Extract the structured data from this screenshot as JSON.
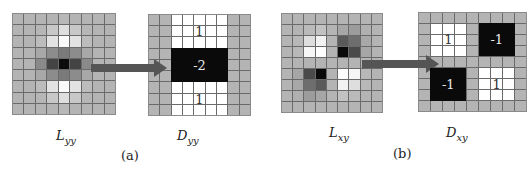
{
  "panels": [
    {
      "id": "a",
      "caption": "(a)",
      "source": {
        "name": "L",
        "subscript": "yy",
        "description": "Discretized Gaussian second-order derivative in y direction",
        "grid_size": 9,
        "cells": [
          [
            "#b4b4b4",
            "#b4b4b4",
            "#b4b4b4",
            "#b4b4b4",
            "#b8b8b8",
            "#b4b4b4",
            "#b4b4b4",
            "#b4b4b4",
            "#b4b4b4"
          ],
          [
            "#b4b4b4",
            "#b4b4b4",
            "#b6b6b6",
            "#c8c8c8",
            "#dedede",
            "#c8c8c8",
            "#b6b6b6",
            "#b4b4b4",
            "#b4b4b4"
          ],
          [
            "#b4b4b4",
            "#b4b4b4",
            "#bcbcbc",
            "#e2e2e2",
            "#fafafa",
            "#e2e2e2",
            "#bcbcbc",
            "#b4b4b4",
            "#b4b4b4"
          ],
          [
            "#b4b4b4",
            "#b4b4b4",
            "#a8a8a8",
            "#8c8c8c",
            "#7a7a7a",
            "#8c8c8c",
            "#a8a8a8",
            "#b4b4b4",
            "#b4b4b4"
          ],
          [
            "#b4b4b4",
            "#b4b4b4",
            "#8a8a8a",
            "#444444",
            "#0c0c0c",
            "#444444",
            "#8a8a8a",
            "#b4b4b4",
            "#b4b4b4"
          ],
          [
            "#b4b4b4",
            "#b4b4b4",
            "#a8a8a8",
            "#8c8c8c",
            "#7a7a7a",
            "#8c8c8c",
            "#a8a8a8",
            "#b4b4b4",
            "#b4b4b4"
          ],
          [
            "#b4b4b4",
            "#b4b4b4",
            "#bcbcbc",
            "#e2e2e2",
            "#fafafa",
            "#e2e2e2",
            "#bcbcbc",
            "#b4b4b4",
            "#b4b4b4"
          ],
          [
            "#b4b4b4",
            "#b4b4b4",
            "#b6b6b6",
            "#c8c8c8",
            "#dedede",
            "#c8c8c8",
            "#b6b6b6",
            "#b4b4b4",
            "#b4b4b4"
          ],
          [
            "#b4b4b4",
            "#b4b4b4",
            "#b4b4b4",
            "#b4b4b4",
            "#b8b8b8",
            "#b4b4b4",
            "#b4b4b4",
            "#b4b4b4",
            "#b4b4b4"
          ]
        ]
      },
      "target": {
        "name": "D",
        "subscript": "yy",
        "description": "Box filter approximation",
        "grid_size": 9,
        "background": "#b4b4b4",
        "regions": [
          {
            "row": 0,
            "col": 2,
            "rows": 3,
            "cols": 5,
            "fill": "white",
            "value": "1"
          },
          {
            "row": 3,
            "col": 2,
            "rows": 3,
            "cols": 5,
            "fill": "black",
            "value": "-2"
          },
          {
            "row": 6,
            "col": 2,
            "rows": 3,
            "cols": 5,
            "fill": "white",
            "value": "1"
          }
        ]
      }
    },
    {
      "id": "b",
      "caption": "(b)",
      "source": {
        "name": "L",
        "subscript": "xy",
        "description": "Discretized Gaussian second-order mixed derivative",
        "grid_size": 9,
        "cells": [
          [
            "#b4b4b4",
            "#b4b4b4",
            "#b4b4b4",
            "#b4b4b4",
            "#b4b4b4",
            "#b4b4b4",
            "#b4b4b4",
            "#b4b4b4",
            "#b4b4b4"
          ],
          [
            "#b4b4b4",
            "#b4b4b4",
            "#bababa",
            "#c2c2c2",
            "#b4b4b4",
            "#a6a6a6",
            "#9c9c9c",
            "#b0b0b0",
            "#b4b4b4"
          ],
          [
            "#b4b4b4",
            "#b8b8b8",
            "#dedede",
            "#f2f2f2",
            "#b4b4b4",
            "#5a5a5a",
            "#6e6e6e",
            "#a8a8a8",
            "#b4b4b4"
          ],
          [
            "#b4b4b4",
            "#b8b8b8",
            "#f6f6f6",
            "#fefefe",
            "#b4b4b4",
            "#0a0a0a",
            "#4a4a4a",
            "#a6a6a6",
            "#b4b4b4"
          ],
          [
            "#b4b4b4",
            "#b4b4b4",
            "#b4b4b4",
            "#b4b4b4",
            "#b4b4b4",
            "#b4b4b4",
            "#b4b4b4",
            "#b4b4b4",
            "#b4b4b4"
          ],
          [
            "#b4b4b4",
            "#a6a6a6",
            "#4a4a4a",
            "#0a0a0a",
            "#b4b4b4",
            "#fefefe",
            "#f6f6f6",
            "#b8b8b8",
            "#b4b4b4"
          ],
          [
            "#b4b4b4",
            "#a8a8a8",
            "#6e6e6e",
            "#5a5a5a",
            "#b4b4b4",
            "#f2f2f2",
            "#dedede",
            "#b8b8b8",
            "#b4b4b4"
          ],
          [
            "#b4b4b4",
            "#b0b0b0",
            "#9c9c9c",
            "#a6a6a6",
            "#b4b4b4",
            "#c2c2c2",
            "#bababa",
            "#b4b4b4",
            "#b4b4b4"
          ],
          [
            "#b4b4b4",
            "#b4b4b4",
            "#b4b4b4",
            "#b4b4b4",
            "#b4b4b4",
            "#b4b4b4",
            "#b4b4b4",
            "#b4b4b4",
            "#b4b4b4"
          ]
        ]
      },
      "target": {
        "name": "D",
        "subscript": "xy",
        "description": "Box filter approximation",
        "grid_size": 9,
        "background": "#b4b4b4",
        "regions": [
          {
            "row": 1,
            "col": 1,
            "rows": 3,
            "cols": 3,
            "fill": "white",
            "value": "1"
          },
          {
            "row": 1,
            "col": 5,
            "rows": 3,
            "cols": 3,
            "fill": "black",
            "value": "-1"
          },
          {
            "row": 5,
            "col": 1,
            "rows": 3,
            "cols": 3,
            "fill": "black",
            "value": "-1"
          },
          {
            "row": 5,
            "col": 5,
            "rows": 3,
            "cols": 3,
            "fill": "white",
            "value": "1"
          }
        ]
      }
    }
  ],
  "colors": {
    "grid_line": "#6a6a6a",
    "neutral_cell": "#b4b4b4",
    "arrow": "#555555",
    "box_black": "#0a0a0a",
    "box_white": "#ffffff"
  }
}
